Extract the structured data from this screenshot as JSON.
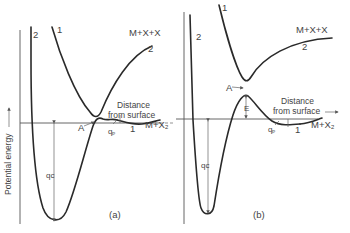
{
  "figure": {
    "y_axis_label": "Potential energy",
    "panels": [
      {
        "id": "a",
        "caption": "(a)",
        "x_axis_label_line1": "Distance",
        "x_axis_label_line2": "from surface",
        "curve_labels": {
          "curve1_top": "1",
          "curve2_left": "2",
          "curve2_right": "2",
          "curve1_right": "1"
        },
        "asymptote_upper": "M+X+X",
        "asymptote_lower": "M+X₂",
        "crossing_label": "A",
        "physisorption_label": "qₚ",
        "chemisorption_label": "qᴄ"
      },
      {
        "id": "b",
        "caption": "(b)",
        "x_axis_label_line1": "Distance",
        "x_axis_label_line2": "from surface",
        "curve_labels": {
          "curve1_top": "1",
          "curve2_left": "2",
          "curve2_right": "2",
          "curve1_right": "1"
        },
        "asymptote_upper": "M+X+X",
        "asymptote_lower": "M+X₂",
        "crossing_label": "A",
        "activation_label": "E",
        "physisorption_label": "qₚ",
        "chemisorption_label": "qᴄ"
      }
    ]
  }
}
